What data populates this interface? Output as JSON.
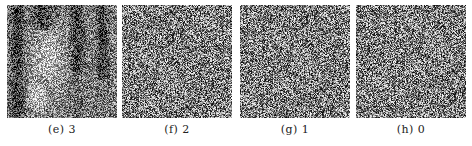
{
  "figure": {
    "panels": [
      {
        "id": "e",
        "label": "(e) 3",
        "value": 3,
        "content": "partially-visible-image-with-noise",
        "x": 7
      },
      {
        "id": "f",
        "label": "(f) 2",
        "value": 2,
        "content": "noise",
        "x": 122
      },
      {
        "id": "g",
        "label": "(g) 1",
        "value": 1,
        "content": "noise",
        "x": 240
      },
      {
        "id": "h",
        "label": "(h) 0",
        "value": 0,
        "content": "noise",
        "x": 356
      }
    ]
  }
}
